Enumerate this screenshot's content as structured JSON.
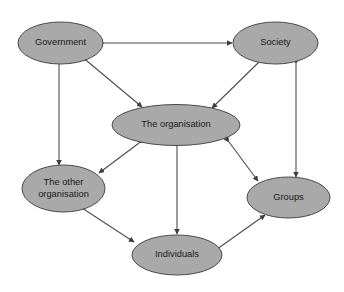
{
  "diagram": {
    "canvas": {
      "width": 344,
      "height": 292,
      "background": "#ffffff"
    },
    "style": {
      "node_fill": "#a9a9a9",
      "node_stroke": "#4a4a4a",
      "edge_color": "#4d4d4d",
      "label_color": "#1a1a1a"
    },
    "nodes": [
      {
        "id": "government",
        "label": "Government",
        "lines": [
          "Government"
        ],
        "cx": 60.5,
        "cy": 43,
        "rx": 42.5,
        "ry": 21
      },
      {
        "id": "society",
        "label": "Society",
        "lines": [
          "Society"
        ],
        "cx": 275.5,
        "cy": 43,
        "rx": 42.5,
        "ry": 21
      },
      {
        "id": "the-organisation",
        "label": "The organisation",
        "lines": [
          "The organisation"
        ],
        "cx": 176,
        "cy": 125,
        "rx": 64,
        "ry": 20.5
      },
      {
        "id": "the-other-organisation",
        "label": "The other organisation",
        "lines": [
          "The other",
          "organisation"
        ],
        "cx": 63.5,
        "cy": 188.5,
        "rx": 41.5,
        "ry": 23.5
      },
      {
        "id": "groups",
        "label": "Groups",
        "lines": [
          "Groups"
        ],
        "cx": 288.5,
        "cy": 197.5,
        "rx": 41.5,
        "ry": 20.5
      },
      {
        "id": "individuals",
        "label": "Individuals",
        "lines": [
          "Individuals"
        ],
        "cx": 177,
        "cy": 255,
        "rx": 45,
        "ry": 20
      }
    ],
    "edges": [
      {
        "id": "government-society",
        "from": "government",
        "to": "society",
        "direction": "both",
        "x1": 104,
        "y1": 43,
        "x2": 232,
        "y2": 43
      },
      {
        "id": "government-other-organisation",
        "from": "government",
        "to": "the-other-organisation",
        "direction": "both",
        "x1": 59,
        "y1": 65,
        "x2": 59,
        "y2": 165
      },
      {
        "id": "society-groups",
        "from": "society",
        "to": "groups",
        "direction": "both",
        "x1": 296,
        "y1": 64,
        "x2": 296,
        "y2": 177
      },
      {
        "id": "government-the-organisation",
        "from": "government",
        "to": "the-organisation",
        "direction": "both",
        "x1": 87,
        "y1": 61,
        "x2": 142,
        "y2": 107
      },
      {
        "id": "society-the-organisation",
        "from": "society",
        "to": "the-organisation",
        "direction": "both",
        "x1": 259,
        "y1": 62,
        "x2": 212,
        "y2": 108
      },
      {
        "id": "the-organisation-other-organisation",
        "from": "the-organisation",
        "to": "the-other-organisation",
        "direction": "both",
        "x1": 139,
        "y1": 143,
        "x2": 99,
        "y2": 173
      },
      {
        "id": "the-organisation-groups",
        "from": "the-organisation",
        "to": "groups",
        "direction": "both",
        "x1": 229,
        "y1": 142,
        "x2": 258,
        "y2": 181
      },
      {
        "id": "the-organisation-individuals",
        "from": "the-organisation",
        "to": "individuals",
        "direction": "both",
        "x1": 177,
        "y1": 146,
        "x2": 177,
        "y2": 234
      },
      {
        "id": "other-organisation-individuals",
        "from": "the-other-organisation",
        "to": "individuals",
        "direction": "both",
        "x1": 82,
        "y1": 208,
        "x2": 134,
        "y2": 242
      },
      {
        "id": "individuals-groups",
        "from": "individuals",
        "to": "groups",
        "direction": "both",
        "x1": 220,
        "y1": 247,
        "x2": 265,
        "y2": 215
      }
    ]
  }
}
